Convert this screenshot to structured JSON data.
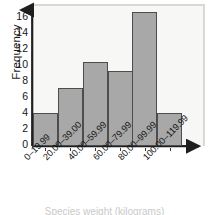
{
  "chart_data": {
    "type": "bar",
    "title": "",
    "subtitle": "",
    "xlabel": "",
    "ylabel": "Frequency",
    "categories": [
      "0–19.99",
      "20.00–39.00",
      "40.00–59.99",
      "60.00–79.99",
      "80.00–99.99",
      "100.00–119.99"
    ],
    "values": [
      4,
      7,
      10,
      9,
      16,
      4
    ],
    "ylim": [
      0,
      17
    ],
    "yticks": [
      0,
      2,
      4,
      6,
      8,
      10,
      12,
      14,
      16
    ],
    "ytick_labels": [
      "0",
      "2",
      "4",
      "6",
      "8",
      "10",
      "12",
      "14",
      "16"
    ],
    "grid": false,
    "legend": null,
    "legend_position": "none",
    "annotations": [],
    "bar_fill_color": "#a8a8a8",
    "bar_edge_color": "#4d4d4d",
    "axis_color": "#1f1f1f",
    "plot_background": "#f7f7f5",
    "figure_background": "#ffffff"
  },
  "figure": {
    "y_axis_label": "Frequency",
    "cutoff_caption": "Species weight (kilograms)",
    "axis_arrow_y": "y-axis-arrow",
    "axis_arrow_x": "x-axis-arrow"
  }
}
